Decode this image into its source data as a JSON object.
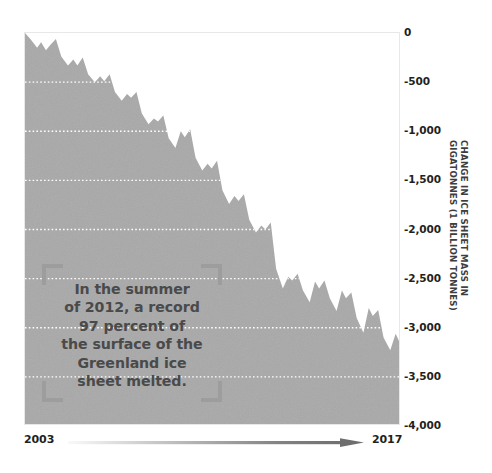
{
  "chart_data": {
    "type": "area",
    "title": "",
    "subtitle": "",
    "xlabel": "",
    "ylabel": "CHANGE IN ICE SHEET MASS IN GIGATONNES (1 BILLION TONNES)",
    "ylabel_lines": [
      "CHANGE IN ICE SHEET MASS IN",
      "GIGATONNES (1 BILLION TONNES)"
    ],
    "xlim": [
      2003,
      2017
    ],
    "ylim": [
      -4000,
      0
    ],
    "grid": true,
    "grid_axis": "y",
    "grid_style": "dotted",
    "grid_color": "#ffffff",
    "legend": "none",
    "fill_color": "#a9a9a9",
    "frame_color": "#e8e8e8",
    "x_tick_labels": [
      "2003",
      "2017"
    ],
    "y_tick_labels": [
      "0",
      "-500",
      "-1,000",
      "-1,500",
      "-2,000",
      "-2,500",
      "-3,000",
      "-3,500",
      "-4,000"
    ],
    "y_tick_values": [
      0,
      -500,
      -1000,
      -1500,
      -2000,
      -2500,
      -3000,
      -3500,
      -4000
    ],
    "series": [
      {
        "name": "Greenland ice sheet mass change",
        "x": [
          2003.0,
          2003.2,
          2003.45,
          2003.6,
          2003.78,
          2003.95,
          2004.15,
          2004.35,
          2004.6,
          2004.8,
          2004.95,
          2005.15,
          2005.35,
          2005.6,
          2005.8,
          2005.95,
          2006.15,
          2006.35,
          2006.6,
          2006.8,
          2006.95,
          2007.15,
          2007.35,
          2007.6,
          2007.8,
          2007.95,
          2008.15,
          2008.35,
          2008.6,
          2008.8,
          2008.95,
          2009.15,
          2009.35,
          2009.6,
          2009.8,
          2009.95,
          2010.15,
          2010.35,
          2010.6,
          2010.8,
          2010.95,
          2011.15,
          2011.35,
          2011.6,
          2011.8,
          2011.95,
          2012.15,
          2012.35,
          2012.6,
          2012.8,
          2012.95,
          2013.15,
          2013.35,
          2013.6,
          2013.8,
          2013.95,
          2014.15,
          2014.35,
          2014.6,
          2014.8,
          2014.95,
          2015.15,
          2015.35,
          2015.6,
          2015.8,
          2015.95,
          2016.15,
          2016.35,
          2016.6,
          2016.8,
          2016.95,
          2017.0
        ],
        "values": [
          0,
          -60,
          -150,
          -95,
          -175,
          -120,
          -60,
          -240,
          -330,
          -270,
          -330,
          -250,
          -420,
          -500,
          -440,
          -490,
          -420,
          -600,
          -690,
          -620,
          -660,
          -600,
          -820,
          -930,
          -870,
          -900,
          -840,
          -1070,
          -1170,
          -1000,
          -1060,
          -980,
          -1270,
          -1400,
          -1330,
          -1380,
          -1300,
          -1600,
          -1740,
          -1660,
          -1710,
          -1640,
          -1900,
          -2030,
          -1960,
          -2000,
          -1930,
          -2400,
          -2600,
          -2480,
          -2520,
          -2450,
          -2620,
          -2740,
          -2530,
          -2600,
          -2520,
          -2700,
          -2830,
          -2620,
          -2700,
          -2640,
          -2900,
          -3050,
          -2800,
          -2880,
          -2820,
          -3100,
          -3230,
          -3060,
          -3150,
          -3800
        ]
      }
    ],
    "annotations": [
      {
        "name": "summer-2012-callout",
        "text": "In the summer of 2012, a record 97 percent of the surface of the Greenland ice sheet melted.",
        "lines": [
          "In the summer",
          "of 2012, a record",
          "97 percent of",
          "the surface of the",
          "Greenland ice",
          "sheet melted."
        ],
        "style": "corner-brackets"
      }
    ]
  },
  "axes": {
    "y": {
      "ticks": [
        {
          "label": "0",
          "value": 0
        },
        {
          "label": "-500",
          "value": -500
        },
        {
          "label": "-1,000",
          "value": -1000
        },
        {
          "label": "-1,500",
          "value": -1500
        },
        {
          "label": "-2,000",
          "value": -2000
        },
        {
          "label": "-2,500",
          "value": -2500
        },
        {
          "label": "-3,000",
          "value": -3000
        },
        {
          "label": "-3,500",
          "value": -3500
        },
        {
          "label": "-4,000",
          "value": -4000
        }
      ],
      "title_line1": "CHANGE IN ICE SHEET MASS IN",
      "title_line2": "GIGATONNES (1 BILLION TONNES)"
    },
    "x": {
      "start_label": "2003",
      "end_label": "2017"
    }
  },
  "annotation": {
    "line1": "In the summer",
    "line2": "of 2012, a record",
    "line3": "97 percent of",
    "line4": "the surface of the",
    "line5": "Greenland ice",
    "line6": "sheet melted."
  },
  "colors": {
    "fill": "#a9a9a9",
    "gridline": "#ffffff",
    "frame": "#e8e8e8",
    "tick_text": "#231f20",
    "annotation_text": "#4a4a4a",
    "bracket": "#9d9d9d",
    "arrow": "#6e6e6e"
  }
}
